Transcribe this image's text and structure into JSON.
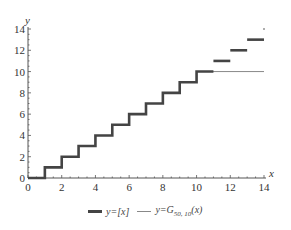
{
  "chart_data": {
    "type": "line",
    "title": "",
    "xlabel": "x",
    "ylabel": "y",
    "xlim": [
      0,
      14
    ],
    "ylim": [
      0,
      14
    ],
    "x_ticks": [
      0,
      2,
      4,
      6,
      8,
      10,
      12,
      14
    ],
    "y_ticks": [
      0,
      2,
      4,
      6,
      8,
      10,
      12,
      14
    ],
    "grid": false,
    "legend_position": "bottom",
    "series": [
      {
        "name": "y=[x]",
        "style": "thick dark step",
        "color": "#444444",
        "segments": [
          {
            "x": [
              0,
              1
            ],
            "y": 0
          },
          {
            "x": [
              1,
              2
            ],
            "y": 1
          },
          {
            "x": [
              2,
              3
            ],
            "y": 2
          },
          {
            "x": [
              3,
              4
            ],
            "y": 3
          },
          {
            "x": [
              4,
              5
            ],
            "y": 4
          },
          {
            "x": [
              5,
              6
            ],
            "y": 5
          },
          {
            "x": [
              6,
              7
            ],
            "y": 6
          },
          {
            "x": [
              7,
              8
            ],
            "y": 7
          },
          {
            "x": [
              8,
              9
            ],
            "y": 8
          },
          {
            "x": [
              9,
              10
            ],
            "y": 9
          },
          {
            "x": [
              10,
              11
            ],
            "y": 10
          },
          {
            "x": [
              11,
              12
            ],
            "y": 11
          },
          {
            "x": [
              12,
              13
            ],
            "y": 12
          },
          {
            "x": [
              13,
              14
            ],
            "y": 13
          },
          {
            "x": [
              14,
              14
            ],
            "y": 14
          }
        ]
      },
      {
        "name": "y=G50,10(x)",
        "style": "thin gray step",
        "color": "#888888",
        "segments": [
          {
            "x": [
              0,
              1
            ],
            "y": 0
          },
          {
            "x": [
              1,
              2
            ],
            "y": 1
          },
          {
            "x": [
              2,
              3
            ],
            "y": 2
          },
          {
            "x": [
              3,
              4
            ],
            "y": 3
          },
          {
            "x": [
              4,
              5
            ],
            "y": 4
          },
          {
            "x": [
              5,
              6
            ],
            "y": 5
          },
          {
            "x": [
              6,
              7
            ],
            "y": 6
          },
          {
            "x": [
              7,
              8
            ],
            "y": 7
          },
          {
            "x": [
              8,
              9
            ],
            "y": 8
          },
          {
            "x": [
              9,
              10
            ],
            "y": 9
          },
          {
            "x": [
              10,
              14
            ],
            "y": 10
          }
        ]
      }
    ]
  },
  "legend": {
    "item1_text": "y=[x]",
    "item2_prefix": "y=G",
    "item2_sub": "50, 10",
    "item2_suffix": "(x)"
  }
}
